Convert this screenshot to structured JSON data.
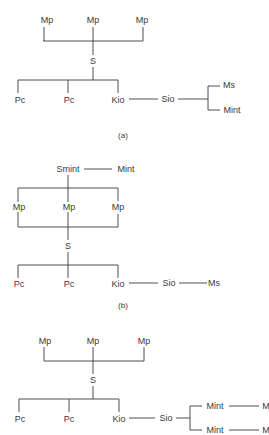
{
  "diagrams": [
    {
      "caption": "(a)",
      "nodes": {
        "mp1": "Mp",
        "mp2": "Mp",
        "mp3": "Mp",
        "s": "S",
        "pc1": "Pc",
        "pc2": "Pc",
        "kio": "Kio",
        "sio": "Sio",
        "ms": "Ms",
        "mint": "Mint"
      }
    },
    {
      "caption": "(b)",
      "nodes": {
        "smint": "Smint",
        "mint": "Mint",
        "mp1": "Mp",
        "mp2": "Mp",
        "mp3": "Mp",
        "s": "S",
        "pc1": "Pc",
        "pc2": "Pc",
        "kio": "Kio",
        "sio": "Sio",
        "ms": "Ms"
      }
    },
    {
      "caption": "",
      "nodes": {
        "mp1": "Mp",
        "mp2": "Mp",
        "mp3": "Mp",
        "s": "S",
        "pc1": "Pc",
        "pc2": "Pc",
        "kio": "Kio",
        "sio": "Sio",
        "mint1": "Mint",
        "m1": "M",
        "mint2": "Mint",
        "m2": "M"
      }
    }
  ],
  "colors": {
    "line": "#3a3a3a",
    "text": "#3a3a3a",
    "background": "#ffffff"
  }
}
